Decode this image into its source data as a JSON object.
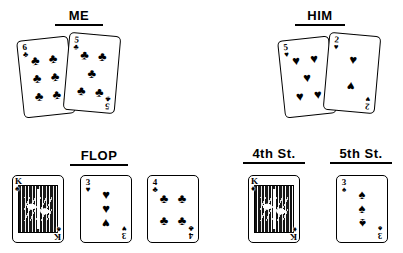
{
  "page": {
    "background": "#ffffff",
    "ink": "#000000"
  },
  "sections": [
    {
      "id": "me",
      "label": "ME"
    },
    {
      "id": "him",
      "label": "HIM"
    },
    {
      "id": "flop",
      "label": "FLOP"
    },
    {
      "id": "fourth",
      "label": "4th  St."
    },
    {
      "id": "fifth",
      "label": "5th  St."
    }
  ],
  "cards": {
    "me": [
      {
        "rank": "6",
        "suit": "clubs",
        "suit_symbol": "♣",
        "label": "6 of clubs",
        "pip_count": 6,
        "face": false
      },
      {
        "rank": "5",
        "suit": "clubs",
        "suit_symbol": "♣",
        "label": "5 of clubs",
        "pip_count": 5,
        "face": false
      }
    ],
    "him": [
      {
        "rank": "5",
        "suit": "hearts",
        "suit_symbol": "♥",
        "label": "5 of hearts",
        "pip_count": 5,
        "face": false
      },
      {
        "rank": "2",
        "suit": "hearts",
        "suit_symbol": "♥",
        "label": "2 of hearts",
        "pip_count": 2,
        "face": false
      }
    ],
    "flop": [
      {
        "rank": "K",
        "suit": "spades",
        "suit_symbol": "♠",
        "label": "King of spades",
        "pip_count": 0,
        "face": true
      },
      {
        "rank": "3",
        "suit": "hearts",
        "suit_symbol": "♥",
        "label": "3 of hearts",
        "pip_count": 3,
        "face": false
      },
      {
        "rank": "4",
        "suit": "clubs",
        "suit_symbol": "♣",
        "label": "4 of clubs",
        "pip_count": 4,
        "face": false
      }
    ],
    "fourth": [
      {
        "rank": "K",
        "suit": "diamonds",
        "suit_symbol": "♦",
        "label": "King of diamonds",
        "pip_count": 0,
        "face": true
      }
    ],
    "fifth": [
      {
        "rank": "3",
        "suit": "spades",
        "suit_symbol": "♠",
        "label": "3 of spades",
        "pip_count": 3,
        "face": false
      }
    ]
  }
}
